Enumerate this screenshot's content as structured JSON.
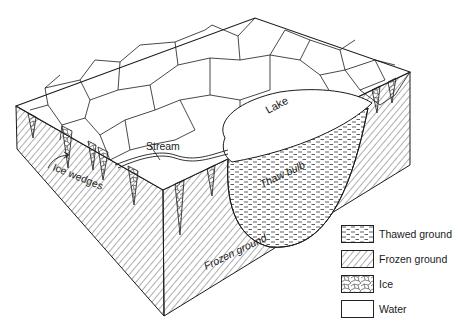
{
  "diagram": {
    "type": "permafrost block diagram",
    "labels": {
      "lake": "Lake",
      "stream": "Stream",
      "ice_wedges": "Ice wedges",
      "thaw_bulb": "Thaw bulb",
      "frozen_ground": "Frozen ground"
    }
  },
  "legend": {
    "items": [
      {
        "key": "thawed",
        "label": "Thawed ground",
        "pattern": "dashes"
      },
      {
        "key": "frozen",
        "label": "Frozen ground",
        "pattern": "diagonal-hatch"
      },
      {
        "key": "ice",
        "label": "Ice",
        "pattern": "polygon-cells"
      },
      {
        "key": "water",
        "label": "Water",
        "pattern": "blank"
      }
    ]
  },
  "colors": {
    "ink": "#1a1a1a",
    "background": "#ffffff"
  }
}
